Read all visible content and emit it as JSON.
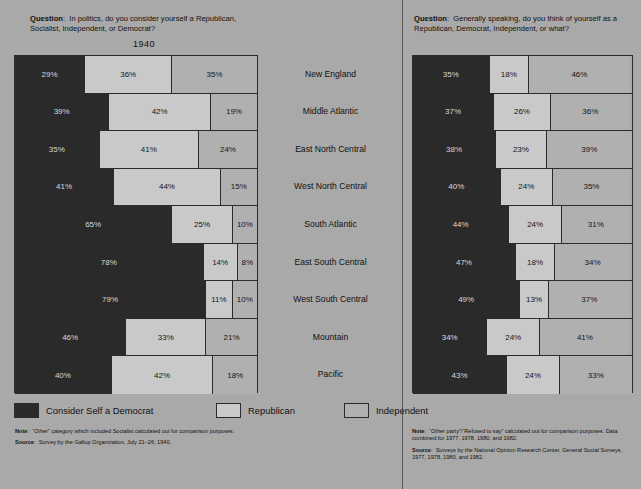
{
  "left": {
    "question_label": "Question",
    "question_text": "In politics, do you consider yourself a Republican, Socialist, Independent, or Democrat?",
    "year": "1940",
    "note_label": "Note",
    "note_text": "“Other” category which included Socialist calculated out for comparison purposes.",
    "source_label": "Source",
    "source_text": "Survey by the Gallup Organization, July 21–26, 1940."
  },
  "right": {
    "question_label": "Question",
    "question_text": "Generally speaking, do you think of yourself as a Republican, Democrat, Independent, or what?",
    "note_label": "Note",
    "note_text": "“Other party”/“Refused to say” calculated out for comparison purposes.  Data combined for 1977, 1978, 1980, and 1982.",
    "source_label": "Source",
    "source_text": "Surveys by the National Opinion Research Center, General Social Surveys, 1977, 1978, 1980, and 1982."
  },
  "legend": [
    {
      "key": "democrat",
      "label": "Consider Self a Democrat",
      "color": "#2a2a2a"
    },
    {
      "key": "republican",
      "label": "Republican",
      "color": "#c9c9c9"
    },
    {
      "key": "independent",
      "label": "Independent",
      "color": "#b0b0b0"
    }
  ],
  "regions": [
    "New England",
    "Middle Atlantic",
    "East North Central",
    "West North Central",
    "South Atlantic",
    "East South Central",
    "West South Central",
    "Mountain",
    "Pacific"
  ],
  "chart_data": [
    {
      "type": "bar",
      "orientation": "horizontal",
      "stacked": true,
      "normalized_percent": true,
      "title": "1940",
      "panel": "left",
      "question": "In politics, do you consider yourself a Republican, Socialist, Independent, or Democrat?",
      "categories": [
        "New England",
        "Middle Atlantic",
        "East North Central",
        "West North Central",
        "South Atlantic",
        "East South Central",
        "West South Central",
        "Mountain",
        "Pacific"
      ],
      "series": [
        {
          "name": "Consider Self a Democrat",
          "color": "#2a2a2a",
          "values": [
            29,
            39,
            35,
            41,
            65,
            78,
            79,
            46,
            40
          ]
        },
        {
          "name": "Republican",
          "color": "#c9c9c9",
          "values": [
            36,
            42,
            41,
            44,
            25,
            14,
            11,
            33,
            42
          ]
        },
        {
          "name": "Independent",
          "color": "#b0b0b0",
          "values": [
            35,
            19,
            24,
            15,
            10,
            8,
            10,
            21,
            18
          ]
        }
      ],
      "labels": [
        [
          "29%",
          "36%",
          "35%"
        ],
        [
          "39%",
          "42%",
          "19%"
        ],
        [
          "35%",
          "41%",
          "24%"
        ],
        [
          "41%",
          "44%",
          "15%"
        ],
        [
          "65%",
          "25%",
          "10%"
        ],
        [
          "78%",
          "14%",
          "8%"
        ],
        [
          "79%",
          "11%",
          "10%"
        ],
        [
          "46%",
          "33%",
          "21%"
        ],
        [
          "40%",
          "42%",
          "18%"
        ]
      ],
      "xlabel": "",
      "ylabel": "",
      "xlim": [
        0,
        100
      ],
      "grid": false,
      "legend_position": "bottom"
    },
    {
      "type": "bar",
      "orientation": "horizontal",
      "stacked": true,
      "normalized_percent": true,
      "title": "",
      "panel": "right",
      "question": "Generally speaking, do you think of yourself as a Republican, Democrat, Independent, or what?",
      "categories": [
        "New England",
        "Middle Atlantic",
        "East North Central",
        "West North Central",
        "South Atlantic",
        "East South Central",
        "West South Central",
        "Mountain",
        "Pacific"
      ],
      "series": [
        {
          "name": "Consider Self a Democrat",
          "color": "#2a2a2a",
          "values": [
            35,
            37,
            38,
            40,
            44,
            47,
            49,
            34,
            43
          ]
        },
        {
          "name": "Republican",
          "color": "#c9c9c9",
          "values": [
            18,
            26,
            23,
            24,
            24,
            18,
            13,
            24,
            24
          ]
        },
        {
          "name": "Independent",
          "color": "#b0b0b0",
          "values": [
            46,
            36,
            39,
            35,
            31,
            34,
            37,
            41,
            33
          ]
        }
      ],
      "labels": [
        [
          "35%",
          "18%",
          "46%"
        ],
        [
          "37%",
          "26%",
          "36%"
        ],
        [
          "38%",
          "23%",
          "39%"
        ],
        [
          "40%",
          "24%",
          "35%"
        ],
        [
          "44%",
          "24%",
          "31%"
        ],
        [
          "47%",
          "18%",
          "34%"
        ],
        [
          "49%",
          "13%",
          "37%"
        ],
        [
          "34%",
          "24%",
          "41%"
        ],
        [
          "43%",
          "24%",
          "33%"
        ]
      ],
      "xlabel": "",
      "ylabel": "",
      "xlim": [
        0,
        100
      ],
      "grid": false,
      "legend_position": "bottom"
    }
  ]
}
